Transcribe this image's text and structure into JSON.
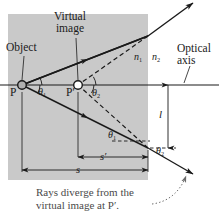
{
  "figure": {
    "colors": {
      "medium_fill": "#c9c9c9",
      "ray": "#1a1a1a",
      "axis": "#1a1a1a",
      "caption_text": "#4a4a4a",
      "label_text": "#1a1a1a",
      "point_fill": "#b0b0b0",
      "image_point_fill": "#ffffff"
    }
  },
  "labels": {
    "virtual_image_line1": "Virtual",
    "virtual_image_line2": "image",
    "object": "Object",
    "n1": "n",
    "n1_sub": "1",
    "n2": "n",
    "n2_sub": "2",
    "optical_axis_line1": "Optical",
    "optical_axis_line2": "axis",
    "point_p": "P",
    "point_p_prime": "P′",
    "theta": "θ",
    "theta1_sub": "1",
    "theta2_sub": "2",
    "length_l": "l",
    "distance_s": "s",
    "distance_s_prime": "s′"
  },
  "caption": {
    "line1": "Rays diverge from the",
    "line2": "virtual image at P′."
  },
  "geometry": {
    "interface_x": 148,
    "axis_y": 85,
    "object_point": [
      22,
      85
    ],
    "image_point": [
      78,
      85
    ],
    "upper_exit": [
      148,
      36
    ],
    "lower_exit": [
      148,
      148
    ],
    "upper_arrow_end": [
      193,
      3
    ],
    "lower_arrow_end": [
      193,
      174
    ]
  }
}
